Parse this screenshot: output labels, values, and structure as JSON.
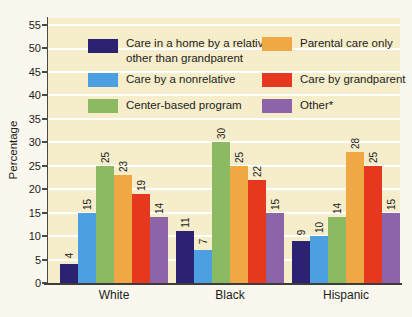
{
  "chart_data": {
    "type": "bar",
    "title": "",
    "categories": [
      "White",
      "Black",
      "Hispanic"
    ],
    "series": [
      {
        "name": "Care in a home by a relative other than grandparent",
        "color": "#2B2272",
        "values": [
          4,
          11,
          9
        ]
      },
      {
        "name": "Care by a nonrelative",
        "color": "#4C9FE0",
        "values": [
          15,
          7,
          10
        ]
      },
      {
        "name": "Center-based program",
        "color": "#8BBA62",
        "values": [
          25,
          30,
          14
        ]
      },
      {
        "name": "Parental care only",
        "color": "#F0A844",
        "values": [
          23,
          25,
          28
        ]
      },
      {
        "name": "Care by grandparent",
        "color": "#E6381F",
        "values": [
          19,
          22,
          25
        ]
      },
      {
        "name": "Other*",
        "color": "#8E64A8",
        "values": [
          14,
          15,
          15
        ]
      }
    ],
    "xlabel": "",
    "ylabel": "Percentage",
    "ylim": [
      0,
      56.5
    ],
    "y_ticks": [
      0,
      5,
      10,
      15,
      20,
      25,
      30,
      35,
      40,
      45,
      50,
      55
    ],
    "grid": "horizontal",
    "grid_color": "#FFFFFF",
    "plot_bg": "#F6EDCB",
    "page_bg": "#FAF7EE",
    "legend_position": "top-inside",
    "legend_columns": 2,
    "value_labels_rotation": -90
  }
}
